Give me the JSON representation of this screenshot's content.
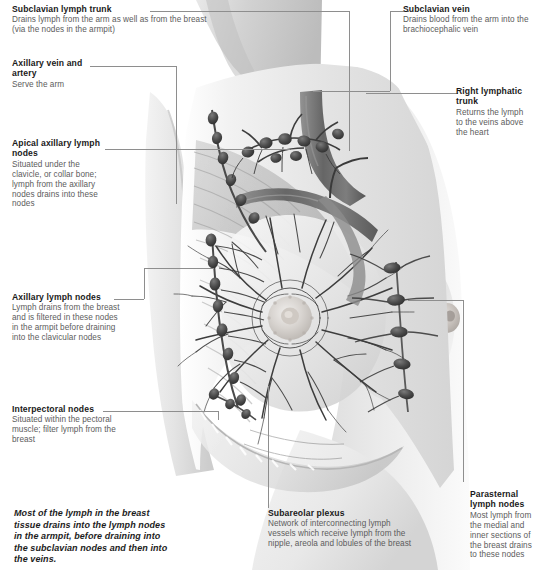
{
  "figure": {
    "background_color": "#ffffff",
    "text_color": "#5c5c5c",
    "heading_color": "#1a1a1a",
    "leader_line_color": "#8e8e8e"
  },
  "callouts": [
    {
      "id": "subclavian-lymph-trunk",
      "title": "Subclavian lymph trunk",
      "body": "Drains lymph from the arm as well as from the breast (via the nodes in the armpit)"
    },
    {
      "id": "axillary-vein-and-artery",
      "title": "Axillary vein and artery",
      "body": "Serve the arm"
    },
    {
      "id": "apical-axillary-lymph-nodes",
      "title": "Apical axillary lymph nodes",
      "body": "Situated under the clavicle, or collar bone; lymph from the axillary nodes drains into these nodes"
    },
    {
      "id": "axillary-lymph-nodes",
      "title": "Axillary lymph nodes",
      "body": "Lymph drains from the breast and is filtered in these nodes in the armpit before draining into the clavicular nodes"
    },
    {
      "id": "interpectoral-nodes",
      "title": "Interpectoral nodes",
      "body": "Situated within the pectoral muscle; filter lymph from the breast"
    },
    {
      "id": "subclavian-vein",
      "title": "Subclavian vein",
      "body": "Drains blood from the arm into the brachiocephalic vein"
    },
    {
      "id": "right-lymphatic-trunk",
      "title": "Right lymphatic trunk",
      "body": "Returns the lymph to the veins above the heart"
    },
    {
      "id": "parasternal-lymph-nodes",
      "title": "Parasternal lymph nodes",
      "body": "Most lymph from the medial and inner sections of the breast drains to these nodes"
    },
    {
      "id": "subareolar-plexus",
      "title": "Subareolar plexus",
      "body": "Network of interconnecting lymph vessels which receive lymph from the nipple, areola and lobules of the breast"
    }
  ],
  "summary": {
    "text": "Most of the lymph in the breast tissue drains into the lymph nodes in the armpit, before draining into the subclavian nodes and then into the veins."
  }
}
